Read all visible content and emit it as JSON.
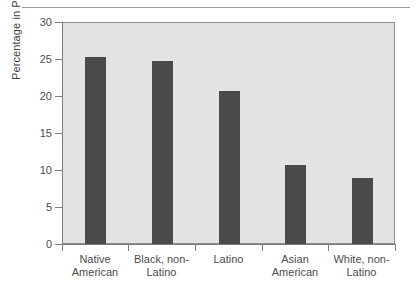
{
  "chart_data": {
    "type": "bar",
    "title": "",
    "xlabel": "",
    "ylabel": "Percentage in Poverty",
    "categories": [
      "Native American",
      "Black, non-Latino",
      "Latino",
      "Asian American",
      "White, non-Latino"
    ],
    "category_lines": [
      [
        "Native",
        "American"
      ],
      [
        "Black, non-",
        "Latino"
      ],
      [
        "Latino",
        ""
      ],
      [
        "Asian",
        "American"
      ],
      [
        "White, non-",
        "Latino"
      ]
    ],
    "values": [
      25.3,
      24.7,
      20.7,
      10.7,
      8.9
    ],
    "ylim": [
      0,
      30
    ],
    "yticks": [
      0,
      5,
      10,
      15,
      20,
      25,
      30
    ],
    "ytick_labels": [
      "0",
      "5",
      "10",
      "15",
      "20",
      "25",
      "30"
    ],
    "grid": false,
    "legend": null,
    "bar_color": "#4a4a4a",
    "plot_background": "#e3e3e3",
    "axis_color": "#7d7d7d"
  }
}
